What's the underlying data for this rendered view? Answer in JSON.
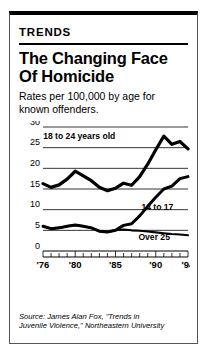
{
  "card": {
    "kicker": "TRENDS",
    "headline_line1": "The Changing Face",
    "headline_line2": "Of Homicide",
    "subtitle": "Rates per 100,000 by age for known offenders.",
    "source_line1": "Source: James Alan Fox, \"Trends in",
    "source_line2": "Juvenile Violence,\" Northeastern University",
    "accent_color": "#000000",
    "background_color": "#ffffff"
  },
  "chart_data": {
    "type": "line",
    "title": "The Changing Face Of Homicide",
    "subtitle": "Rates per 100,000 by age for known offenders.",
    "xlabel": "",
    "ylabel": "",
    "ylim": [
      0,
      30
    ],
    "xlim": [
      1976,
      1994
    ],
    "yticks": [
      0,
      5,
      10,
      15,
      20,
      25,
      30
    ],
    "ytick_labels": [
      "0",
      "5",
      "10",
      "15",
      "20",
      "25",
      "30"
    ],
    "xticks": [
      1976,
      1980,
      1985,
      1990,
      1994
    ],
    "xtick_labels": [
      "'76",
      "'80",
      "'85",
      "'90",
      "'94"
    ],
    "grid": true,
    "legend": "inline-annotations",
    "x": [
      1976,
      1977,
      1978,
      1979,
      1980,
      1981,
      1982,
      1983,
      1984,
      1985,
      1986,
      1987,
      1988,
      1989,
      1990,
      1991,
      1992,
      1993,
      1994
    ],
    "series": [
      {
        "name": "18 to 24 years old",
        "label": "18 to 24 years old",
        "values": [
          16.3,
          15.4,
          16.0,
          17.4,
          19.3,
          18.2,
          17.0,
          15.4,
          14.6,
          15.2,
          16.4,
          15.9,
          18.0,
          21.0,
          24.5,
          27.8,
          25.8,
          26.5,
          24.7
        ]
      },
      {
        "name": "14 to 17",
        "label": "14 to 17",
        "values": [
          6.0,
          5.4,
          5.6,
          6.0,
          6.3,
          6.0,
          5.6,
          4.8,
          4.6,
          5.0,
          6.2,
          6.6,
          8.5,
          10.8,
          13.0,
          15.0,
          15.7,
          17.5,
          18.0
        ]
      },
      {
        "name": "Over 25",
        "label": "Over 25",
        "values": [
          6.0,
          5.4,
          5.6,
          6.0,
          6.3,
          6.0,
          5.6,
          4.8,
          4.6,
          5.0,
          5.2,
          5.0,
          4.9,
          4.7,
          4.5,
          4.3,
          4.1,
          4.0,
          3.8
        ]
      }
    ],
    "annotations": [
      {
        "text": "18 to 24 years old",
        "x": 1980.5,
        "y": 27.0
      },
      {
        "text": "14 to 17",
        "x": 1990.2,
        "y": 10.0
      },
      {
        "text": "Over 25",
        "x": 1989.8,
        "y": 2.6
      }
    ]
  }
}
